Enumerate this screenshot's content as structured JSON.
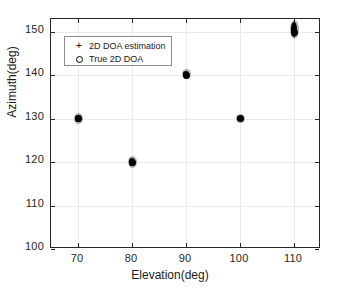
{
  "figure": {
    "background_color": "#ffffff",
    "axis_color": "#262626",
    "grid_color": "#eaeaea",
    "marker_color": "#000000"
  },
  "legend": {
    "position": "upper-left-inside",
    "entries": [
      {
        "marker": "plus-marker",
        "glyph": "+",
        "label": "2D DOA estimation"
      },
      {
        "marker": "circle-marker",
        "glyph": "o",
        "label": "True 2D DOA"
      }
    ]
  },
  "caption": {
    "fragment": ""
  },
  "chart_data": {
    "type": "scatter",
    "title": "",
    "xlabel": "Elevation(deg)",
    "ylabel": "Azimuth(deg)",
    "xlim": [
      65,
      115
    ],
    "ylim": [
      100,
      153
    ],
    "xticks": [
      70,
      80,
      90,
      100,
      110
    ],
    "yticks": [
      100,
      110,
      120,
      130,
      140,
      150
    ],
    "xticklabels": [
      "70",
      "80",
      "90",
      "100",
      "110"
    ],
    "yticklabels": [
      "100",
      "110",
      "120",
      "130",
      "140",
      "150"
    ],
    "grid": true,
    "legend_position": "upper left",
    "series": [
      {
        "name": "2D DOA estimation",
        "marker": "+",
        "description": "Monte-Carlo estimates forming dense vertical clusters around each true source",
        "clusters": [
          {
            "x": 70,
            "y_center": 130.0,
            "y_min": 129.2,
            "y_max": 130.8
          },
          {
            "x": 80,
            "y_center": 120.0,
            "y_min": 119.2,
            "y_max": 120.9
          },
          {
            "x": 90,
            "y_center": 140.4,
            "y_min": 139.7,
            "y_max": 141.1
          },
          {
            "x": 100,
            "y_center": 130.0,
            "y_min": 129.4,
            "y_max": 130.6
          },
          {
            "x": 110,
            "y_center": 150.6,
            "y_min": 148.9,
            "y_max": 152.3
          }
        ]
      },
      {
        "name": "True 2D DOA",
        "marker": "o",
        "description": "True source directions at the centre of each estimate cluster",
        "points": [
          {
            "x": 70,
            "y": 130
          },
          {
            "x": 80,
            "y": 120
          },
          {
            "x": 90,
            "y": 140
          },
          {
            "x": 100,
            "y": 130
          },
          {
            "x": 110,
            "y": 150
          }
        ]
      }
    ]
  }
}
